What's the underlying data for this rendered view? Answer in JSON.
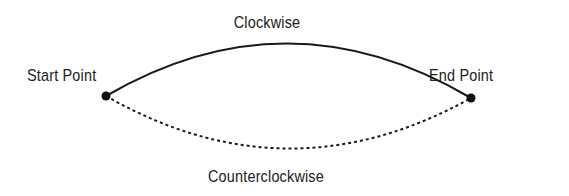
{
  "diagram": {
    "type": "arc-direction",
    "labels": {
      "clockwise": "Clockwise",
      "counterclockwise": "Counterclockwise",
      "start": "Start Point",
      "end": "End Point"
    },
    "points": {
      "start": {
        "x": 106,
        "y": 96
      },
      "end": {
        "x": 471,
        "y": 98
      }
    },
    "arcs": [
      {
        "name": "Clockwise",
        "style": "solid",
        "apex_y": 44
      },
      {
        "name": "Counterclockwise",
        "style": "dashed",
        "apex_y": 148
      }
    ],
    "colors": {
      "line": "#1a1a1a",
      "text": "#222222",
      "background": "#ffffff"
    }
  }
}
